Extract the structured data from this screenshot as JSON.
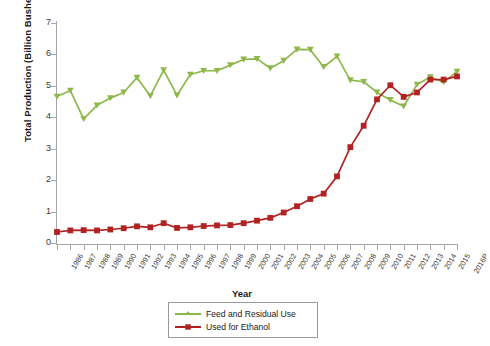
{
  "chart_data": {
    "type": "line",
    "title": "",
    "xlabel": "Year",
    "ylabel": "Total Production (Billion Bushels Corn)",
    "ylim": [
      0,
      7
    ],
    "ytick_step": 1,
    "yticks": [
      "0",
      "1",
      "2",
      "3",
      "4",
      "5",
      "6",
      "7"
    ],
    "grid": false,
    "legend_position": "bottom-center",
    "categories": [
      "1986",
      "1987",
      "1988",
      "1989",
      "1990",
      "1991",
      "1992",
      "1993",
      "1994",
      "1995",
      "1996",
      "1997",
      "1998",
      "1999",
      "2000",
      "2001",
      "2002",
      "2003",
      "2004",
      "2005",
      "2006",
      "2007",
      "2008",
      "2009",
      "2010",
      "2011",
      "2012",
      "2013",
      "2014",
      "2015",
      "2016P"
    ],
    "series": [
      {
        "name": "Feed and Residual Use",
        "color": "#8DB84A",
        "marker": "triangle",
        "values": [
          4.66,
          4.85,
          3.95,
          4.38,
          4.61,
          4.79,
          5.26,
          4.68,
          5.5,
          4.7,
          5.36,
          5.48,
          5.48,
          5.66,
          5.84,
          5.86,
          5.56,
          5.8,
          6.16,
          6.15,
          5.6,
          5.94,
          5.18,
          5.13,
          4.79,
          4.55,
          4.35,
          5.04,
          5.28,
          5.12,
          5.45
        ]
      },
      {
        "name": "Used for Ethanol",
        "color": "#B22222",
        "marker": "square",
        "values": [
          0.35,
          0.4,
          0.41,
          0.4,
          0.43,
          0.47,
          0.53,
          0.5,
          0.63,
          0.48,
          0.5,
          0.54,
          0.56,
          0.57,
          0.63,
          0.71,
          0.8,
          0.97,
          1.17,
          1.4,
          1.57,
          2.12,
          3.05,
          3.73,
          4.57,
          5.02,
          4.65,
          4.79,
          5.2,
          5.2,
          5.3
        ]
      }
    ]
  },
  "legend": {
    "items": [
      {
        "label": "Feed and Residual Use"
      },
      {
        "label": "Used for Ethanol"
      }
    ]
  },
  "colors": {
    "feed_green": "#8DB84A",
    "ethanol_red": "#B22222",
    "axis_gray": "#a6a6a6",
    "text_dark": "#1a1a1a"
  }
}
